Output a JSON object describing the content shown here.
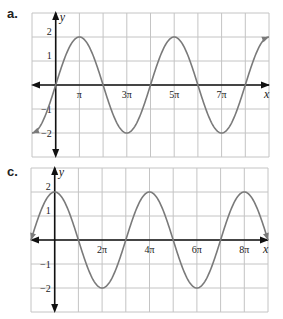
{
  "chart_data": [
    {
      "panel": "a.",
      "type": "line",
      "title": "",
      "xlabel": "x",
      "ylabel": "y",
      "function_depicted": "y = 2 sin(x/2)",
      "xlim_pi": [
        -1,
        9
      ],
      "ylim": [
        -3,
        3
      ],
      "grid": true,
      "x_tick_labels": [
        "π",
        "3π",
        "5π",
        "7π"
      ],
      "x_tick_positions_pi": [
        1,
        3,
        5,
        7
      ],
      "y_tick_labels": [
        "2",
        "1",
        "-1",
        "-2"
      ],
      "y_tick_values": [
        2,
        1,
        -1,
        -2
      ],
      "x_pi": [
        -1,
        0,
        1,
        2,
        3,
        4,
        5,
        6,
        7,
        8,
        9
      ],
      "y": [
        -2,
        0,
        2,
        0,
        -2,
        0,
        2,
        0,
        -2,
        0,
        2
      ],
      "curve_color": "#7a7a7a",
      "grid_color": "#c4c4c4",
      "axis_color": "#111111"
    },
    {
      "panel": "c.",
      "type": "line",
      "title": "",
      "xlabel": "x",
      "ylabel": "y",
      "function_depicted": "y = 2 cos(x/2)",
      "xlim_pi": [
        -1,
        9
      ],
      "ylim": [
        -3,
        3
      ],
      "grid": true,
      "x_tick_labels": [
        "2π",
        "4π",
        "6π",
        "8π"
      ],
      "x_tick_positions_pi": [
        2,
        4,
        6,
        8
      ],
      "y_tick_labels": [
        "2",
        "1",
        "-1",
        "-2"
      ],
      "y_tick_values": [
        2,
        1,
        -1,
        -2
      ],
      "x_pi": [
        -1,
        0,
        1,
        2,
        3,
        4,
        5,
        6,
        7,
        8,
        9
      ],
      "y": [
        0,
        2,
        0,
        -2,
        0,
        2,
        0,
        -2,
        0,
        2,
        0
      ],
      "curve_color": "#7a7a7a",
      "grid_color": "#c4c4c4",
      "axis_color": "#111111"
    }
  ],
  "labels": {
    "panel_a": "a.",
    "panel_c": "c.",
    "x_axis": "x",
    "y_axis": "y"
  }
}
